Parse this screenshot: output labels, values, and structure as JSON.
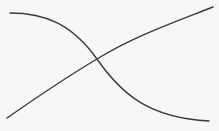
{
  "diagram": {
    "width": 219,
    "height": 131,
    "background": "#f7f7f6",
    "stroke_color": "#3a3a3a",
    "stroke_width": 1.4,
    "curves": [
      {
        "name": "decreasing-s-curve",
        "path": "M 10 13 C 45 13, 72 24, 97 59 C 122 95, 150 118, 209 121"
      },
      {
        "name": "increasing-curve",
        "path": "M 7 118 C 40 95, 70 75, 97 59 C 135 36, 170 24, 213 7"
      }
    ],
    "intersection": {
      "x": 97,
      "y": 59
    }
  }
}
